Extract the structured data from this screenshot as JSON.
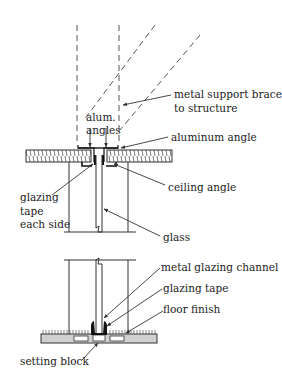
{
  "diagram": {
    "type": "architectural-section",
    "colors": {
      "line": "#333333",
      "text": "#222222",
      "background": "#ffffff",
      "floor_fill": "#d0d0d0"
    },
    "labels": {
      "metal_support_1": "metal support braced",
      "metal_support_2": "to structure",
      "alum_angles_1": "alum.",
      "alum_angles_2": "angles",
      "aluminum_angle": "aluminum angle",
      "ceiling_angle": "ceiling angle",
      "glazing_tape_1": "glazing",
      "glazing_tape_2": "tape",
      "glazing_tape_3": "each side",
      "glass": "glass",
      "metal_glazing_channel": "metal glazing channel",
      "glazing_tape": "glazing tape",
      "floor_finish": "floor finish",
      "setting_block": "setting block"
    }
  }
}
